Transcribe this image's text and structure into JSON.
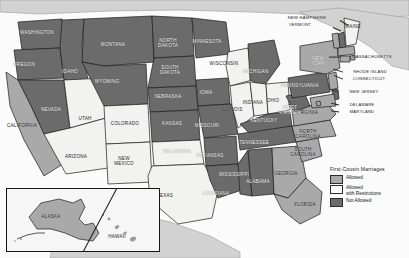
{
  "map": {
    "title": "First-Cousin Marriages",
    "legend": {
      "title": "First-Cousin Marriages",
      "items": [
        {
          "label": "Allowed",
          "color": "#a9a9a9",
          "key": "allowed"
        },
        {
          "label": "Allowed\nwith Restrictions",
          "color": "#fbfbfb",
          "key": "restricted"
        },
        {
          "label": "Not Allowed",
          "color": "#6b6b6b",
          "key": "notallowed"
        }
      ]
    },
    "inset": {
      "alaska_label": "ALASKA",
      "hawaii_label": "HAWAII"
    },
    "labels": [
      {
        "name": "washington",
        "text": "WASHINGTON",
        "x": 37,
        "y": 33,
        "dark": true
      },
      {
        "name": "oregon",
        "text": "OREGON",
        "x": 24,
        "y": 65,
        "dark": true
      },
      {
        "name": "idaho",
        "text": "IDAHO",
        "x": 70,
        "y": 72,
        "dark": true
      },
      {
        "name": "montana",
        "text": "MONTANA",
        "x": 113,
        "y": 45,
        "dark": true
      },
      {
        "name": "north-dakota",
        "text": "NORTH\nDAKOTA",
        "x": 168,
        "y": 43,
        "dark": true
      },
      {
        "name": "south-dakota",
        "text": "SOUTH\nDAKOTA",
        "x": 170,
        "y": 70,
        "dark": true
      },
      {
        "name": "minnesota",
        "text": "MINNESOTA",
        "x": 207,
        "y": 42,
        "dark": true
      },
      {
        "name": "wisconsin",
        "text": "WISCONSIN",
        "x": 224,
        "y": 64,
        "dark": false
      },
      {
        "name": "michigan",
        "text": "MICHIGAN",
        "x": 256,
        "y": 72,
        "dark": true
      },
      {
        "name": "wyoming",
        "text": "WYOMING",
        "x": 107,
        "y": 82,
        "dark": true
      },
      {
        "name": "nebraska",
        "text": "NEBRASKA",
        "x": 168,
        "y": 97,
        "dark": true
      },
      {
        "name": "iowa",
        "text": "IOWA",
        "x": 206,
        "y": 93,
        "dark": true
      },
      {
        "name": "illinois",
        "text": "ILLINOIS",
        "x": 232,
        "y": 110,
        "dark": false
      },
      {
        "name": "indiana",
        "text": "INDIANA",
        "x": 253,
        "y": 103,
        "dark": false
      },
      {
        "name": "ohio",
        "text": "OHIO",
        "x": 273,
        "y": 101,
        "dark": false
      },
      {
        "name": "nevada",
        "text": "NEVADA",
        "x": 51,
        "y": 110,
        "dark": true
      },
      {
        "name": "utah",
        "text": "UTAH",
        "x": 85,
        "y": 119,
        "dark": false
      },
      {
        "name": "colorado",
        "text": "COLORADO",
        "x": 125,
        "y": 124,
        "dark": false
      },
      {
        "name": "kansas",
        "text": "KANSAS",
        "x": 172,
        "y": 124,
        "dark": true
      },
      {
        "name": "missouri",
        "text": "MISSOURI",
        "x": 207,
        "y": 126,
        "dark": true
      },
      {
        "name": "kentucky",
        "text": "KENTUCKY",
        "x": 264,
        "y": 121,
        "dark": true
      },
      {
        "name": "california",
        "text": "CALIFORNIA",
        "x": 22,
        "y": 126,
        "dark": false
      },
      {
        "name": "arizona",
        "text": "ARIZONA",
        "x": 76,
        "y": 157,
        "dark": false
      },
      {
        "name": "new-mexico",
        "text": "NEW\nMEXICO",
        "x": 124,
        "y": 161,
        "dark": false
      },
      {
        "name": "oklahoma",
        "text": "OKLAHOMA",
        "x": 177,
        "y": 152,
        "dark": true
      },
      {
        "name": "arkansas",
        "text": "ARKANSAS",
        "x": 210,
        "y": 156,
        "dark": true
      },
      {
        "name": "tennessee",
        "text": "TENNESSEE",
        "x": 254,
        "y": 143,
        "dark": true
      },
      {
        "name": "texas",
        "text": "TEXAS",
        "x": 165,
        "y": 196,
        "dark": false
      },
      {
        "name": "louisiana",
        "text": "LOUISIANA",
        "x": 216,
        "y": 194,
        "dark": true
      },
      {
        "name": "mississippi",
        "text": "MISSISSIPPI",
        "x": 234,
        "y": 175,
        "dark": true
      },
      {
        "name": "alabama",
        "text": "ALABAMA",
        "x": 258,
        "y": 182,
        "dark": true
      },
      {
        "name": "georgia",
        "text": "GEORGIA",
        "x": 286,
        "y": 174,
        "dark": false
      },
      {
        "name": "florida",
        "text": "FLORIDA",
        "x": 305,
        "y": 205,
        "dark": false
      },
      {
        "name": "south-carolina",
        "text": "SOUTH\nCAROLINA",
        "x": 303,
        "y": 152,
        "dark": false
      },
      {
        "name": "north-carolina",
        "text": "NORTH\nCAROLINA",
        "x": 308,
        "y": 134,
        "dark": false
      },
      {
        "name": "virginia",
        "text": "VIRGINIA",
        "x": 307,
        "y": 113,
        "dark": false
      },
      {
        "name": "west-virginia",
        "text": "WEST\nVIRGINIA",
        "x": 290,
        "y": 110,
        "dark": true
      },
      {
        "name": "pennsylvania",
        "text": "PENNSYLVANIA",
        "x": 300,
        "y": 86,
        "dark": true
      },
      {
        "name": "new-york",
        "text": "NEW\nYORK",
        "x": 318,
        "y": 61,
        "dark": true
      },
      {
        "name": "maine",
        "text": "MAINE",
        "x": 353,
        "y": 27,
        "dark": false
      },
      {
        "name": "dc",
        "text": "D.C.",
        "x": 293,
        "y": 104,
        "dark": false
      }
    ],
    "callout_labels": [
      {
        "name": "new-hampshire",
        "text": "NEW HAMPSHIRE",
        "x": 307,
        "y": 18
      },
      {
        "name": "vermont",
        "text": "VERMONT",
        "x": 300,
        "y": 25
      },
      {
        "name": "massachusetts",
        "text": "MASSACHUSETTS",
        "x": 372,
        "y": 57
      },
      {
        "name": "rhode-island",
        "text": "RHODE ISLAND",
        "x": 370,
        "y": 72
      },
      {
        "name": "connecticut",
        "text": "CONNECTICUT",
        "x": 369,
        "y": 79
      },
      {
        "name": "new-jersey",
        "text": "NEW JERSEY",
        "x": 364,
        "y": 92
      },
      {
        "name": "delaware",
        "text": "DELAWARE",
        "x": 362,
        "y": 105
      },
      {
        "name": "maryland",
        "text": "MARYLAND",
        "x": 362,
        "y": 112
      }
    ],
    "states": {
      "allowed": [
        "California",
        "New York",
        "Georgia",
        "Florida",
        "South Carolina",
        "North Carolina",
        "Virginia",
        "Alaska",
        "Hawaii",
        "Maryland",
        "New Jersey",
        "Massachusetts",
        "Rhode Island",
        "Connecticut",
        "Vermont",
        "New Mexico",
        "Alabama"
      ],
      "restricted": [
        "Utah",
        "Arizona",
        "Colorado",
        "Texas",
        "Oklahoma",
        "Wisconsin",
        "Illinois",
        "Indiana",
        "Ohio",
        "Maine"
      ],
      "notallowed": [
        "Washington",
        "Oregon",
        "Idaho",
        "Nevada",
        "Montana",
        "Wyoming",
        "North Dakota",
        "South Dakota",
        "Nebraska",
        "Kansas",
        "Minnesota",
        "Iowa",
        "Missouri",
        "Arkansas",
        "Louisiana",
        "Mississippi",
        "Tennessee",
        "Kentucky",
        "Michigan",
        "West Virginia",
        "Pennsylvania",
        "New Hampshire",
        "Delaware"
      ]
    }
  }
}
